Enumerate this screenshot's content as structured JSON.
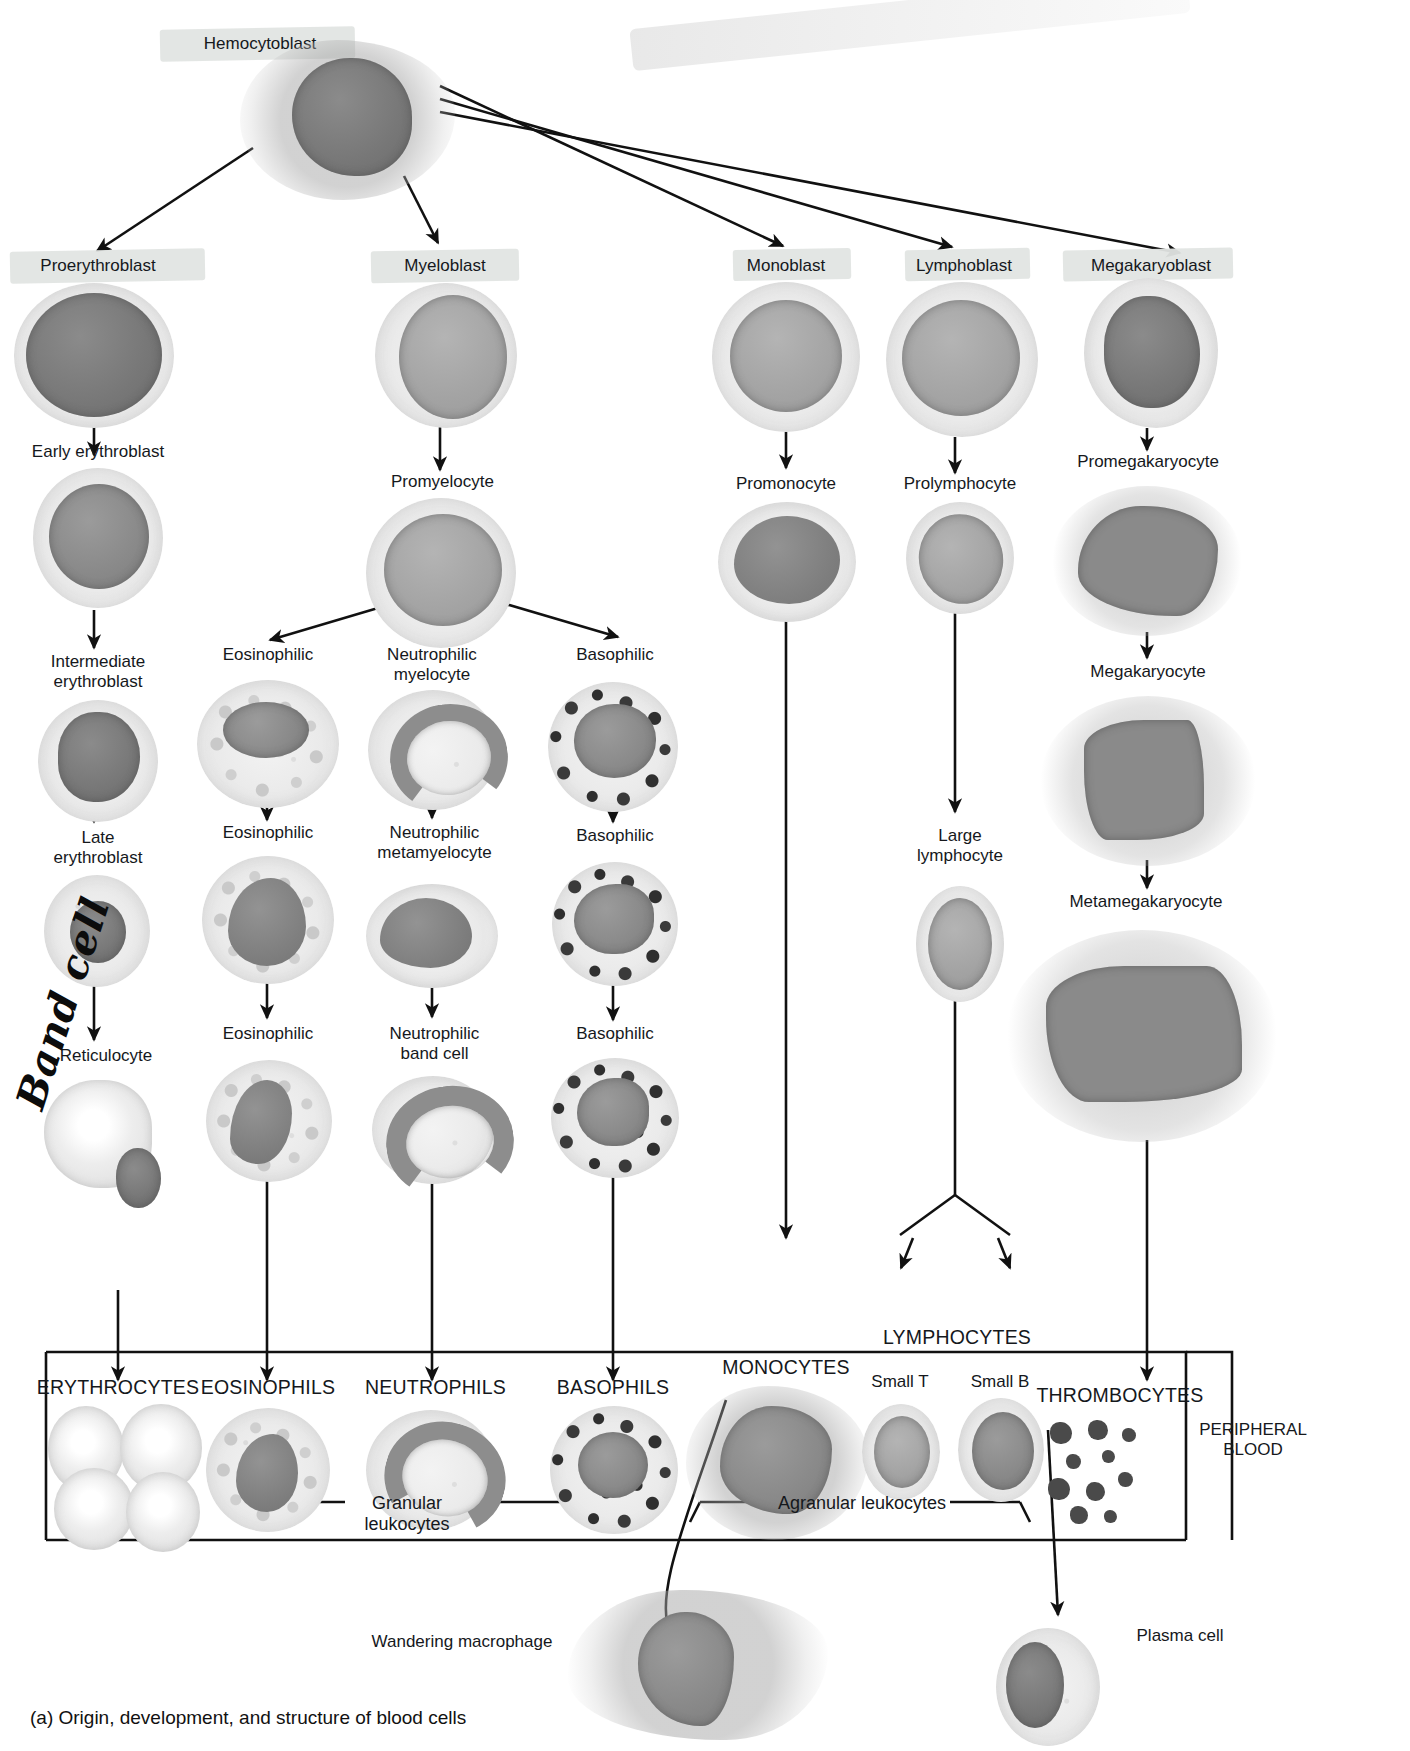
{
  "figure": {
    "caption": "(a) Origin, development, and structure of blood cells",
    "handwritten_note": "Band cell"
  },
  "stem": {
    "label": "Hemocytoblast",
    "highlighted": true
  },
  "lineages": [
    {
      "id": "erythroid",
      "blast": {
        "label": "Proerythroblast",
        "highlighted": true
      },
      "stages": [
        "Early erythroblast",
        "Intermediate\nerythroblast",
        "Late\nerythroblast",
        "Reticulocyte"
      ],
      "mature": "ERYTHROCYTES"
    },
    {
      "id": "myeloid",
      "blast": {
        "label": "Myeloblast",
        "highlighted": true
      },
      "stages": [
        "Promyelocyte"
      ],
      "branches": [
        {
          "id": "eosinophil",
          "stages": [
            "Eosinophilic",
            "Eosinophilic",
            "Eosinophilic"
          ],
          "mature": "EOSINOPHILS"
        },
        {
          "id": "neutrophil",
          "stages": [
            "Neutrophilic\nmyelocyte",
            "Neutrophilic\nmetamyelocyte",
            "Neutrophilic\nband cell"
          ],
          "mature": "NEUTROPHILS"
        },
        {
          "id": "basophil",
          "stages": [
            "Basophilic",
            "Basophilic",
            "Basophilic"
          ],
          "mature": "BASOPHILS"
        }
      ]
    },
    {
      "id": "monocytic",
      "blast": {
        "label": "Monoblast",
        "highlighted": true
      },
      "stages": [
        "Promonocyte"
      ],
      "mature": "MONOCYTES"
    },
    {
      "id": "lymphoid",
      "blast": {
        "label": "Lymphoblast",
        "highlighted": true
      },
      "stages": [
        "Prolymphocyte",
        "Large\nlymphocyte"
      ],
      "mature": "LYMPHOCYTES",
      "subsets": [
        "Small T",
        "Small B"
      ]
    },
    {
      "id": "thrombocytic",
      "blast": {
        "label": "Megakaryoblast",
        "highlighted": true
      },
      "stages": [
        "Promegakaryocyte",
        "Megakaryocyte",
        "Metamegakaryocyte"
      ],
      "mature": "THROMBOCYTES"
    }
  ],
  "brackets": {
    "granular": "Granular leukocytes",
    "agranular": "Agranular leukocytes"
  },
  "compartment": {
    "label": "PERIPHERAL\nBLOOD"
  },
  "terminal": [
    {
      "label": "Wandering macrophage"
    },
    {
      "label": "Plasma cell"
    }
  ],
  "colors": {
    "ink": "#111111",
    "highlight": "#e2e5e3",
    "nucleus": "#8a8a8a",
    "cytoplasm": "#eeeeee",
    "basophil_granule": "#333333"
  }
}
